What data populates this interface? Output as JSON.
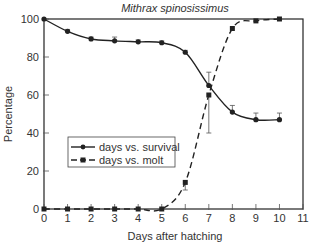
{
  "chart_data": {
    "type": "line",
    "title": "Mithrax spinosissimus",
    "xlabel": "Days after hatching",
    "ylabel": "Percentage",
    "xlim": [
      0,
      11
    ],
    "ylim": [
      0,
      100
    ],
    "x_ticks": [
      0,
      1,
      2,
      3,
      4,
      5,
      6,
      7,
      8,
      9,
      10,
      11
    ],
    "y_ticks": [
      0,
      20,
      40,
      60,
      80,
      100
    ],
    "grid": false,
    "legend_position": "center-left",
    "x": [
      0,
      1,
      2,
      3,
      4,
      5,
      6,
      7,
      8,
      9,
      10
    ],
    "series": [
      {
        "name": "days vs. survival",
        "style": "solid",
        "marker": "circle",
        "values": [
          100,
          93.5,
          89.5,
          88.5,
          88,
          87.5,
          82.5,
          65,
          51,
          47,
          47
        ],
        "error_up": [
          0,
          1,
          1,
          2,
          1,
          1,
          1,
          7,
          3.5,
          3.5,
          3.5
        ]
      },
      {
        "name": "days vs. molt",
        "style": "dashed",
        "marker": "square",
        "values": [
          0,
          0,
          0,
          0,
          0,
          0,
          14,
          60,
          95,
          99,
          100
        ],
        "error_up": [
          0,
          0,
          0,
          0,
          0,
          0,
          0,
          0,
          0,
          0,
          0
        ],
        "error_down": [
          0,
          0,
          0,
          0,
          0,
          0,
          4,
          20,
          0,
          0,
          0
        ]
      }
    ]
  }
}
